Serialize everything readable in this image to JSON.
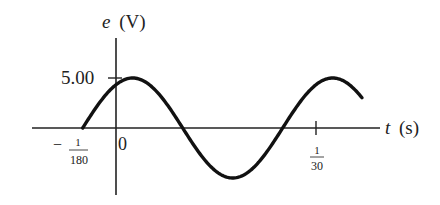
{
  "chart_data": {
    "type": "line",
    "title": "",
    "xlabel": "t (s)",
    "ylabel": "e (V)",
    "y_axis_var": "e",
    "y_axis_unit": "(V)",
    "x_axis_var": "t",
    "x_axis_unit": "(s)",
    "function": "e = 5.00 sin(2π·30·t + π/3)",
    "amplitude": 5.0,
    "x_ticks": [
      {
        "label_sign": "−",
        "numerator": "1",
        "denominator": "180",
        "value": -0.005556
      },
      {
        "label": "0",
        "value": 0
      },
      {
        "numerator": "1",
        "denominator": "30",
        "value": 0.033333
      }
    ],
    "y_ticks": [
      {
        "label": "5.00",
        "value": 5.0
      }
    ],
    "series": [
      {
        "name": "e(t)",
        "x": [
          -0.005556,
          0.002778,
          0.011111,
          0.019444,
          0.027778,
          0.036111,
          0.04
        ],
        "values": [
          0,
          5.0,
          0,
          -5.0,
          0,
          5.0,
          3.83
        ]
      }
    ],
    "xlim": [
      -0.014,
      0.044
    ],
    "ylim": [
      -5.5,
      6.5
    ],
    "grid": false,
    "legend": "none"
  }
}
